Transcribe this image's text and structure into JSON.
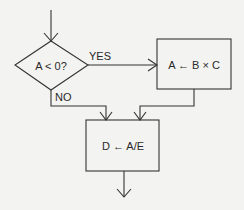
{
  "flowchart": {
    "decision": {
      "label": "A < 0?"
    },
    "branch_yes": {
      "label": "YES"
    },
    "branch_no": {
      "label": "NO"
    },
    "process_multiply": {
      "label": "A ← B × C"
    },
    "process_divide": {
      "label": "D ← A/E"
    }
  },
  "colors": {
    "background": "#f3f3f1",
    "stroke": "#333333"
  }
}
